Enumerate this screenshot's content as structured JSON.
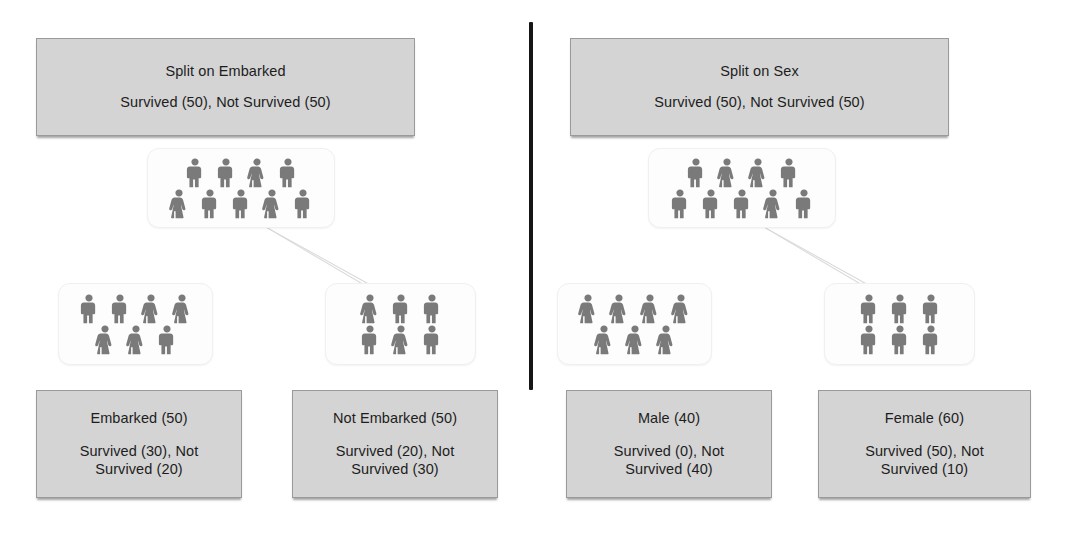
{
  "figure": {
    "type": "decision-tree-comparison",
    "divider": {
      "color": "#161616"
    }
  },
  "panels": [
    {
      "id": "embarked",
      "root_box": {
        "title": "Split on Embarked",
        "stats": "Survived (50), Not Survived (50)"
      },
      "root_node": {
        "rows": [
          [
            "male",
            "male",
            "female",
            "male"
          ],
          [
            "female",
            "male",
            "male",
            "female",
            "male"
          ]
        ]
      },
      "children": [
        {
          "node": {
            "rows": [
              [
                "male",
                "male",
                "female",
                "female"
              ],
              [
                "female",
                "female",
                "male"
              ]
            ]
          },
          "box": {
            "title": "Embarked (50)",
            "stats_line1": "Survived (30), Not",
            "stats_line2": "Survived (20)"
          }
        },
        {
          "node": {
            "rows": [
              [
                "female",
                "male",
                "male"
              ],
              [
                "male",
                "female",
                "male"
              ]
            ]
          },
          "box": {
            "title": "Not Embarked (50)",
            "stats_line1": "Survived (20), Not",
            "stats_line2": "Survived (30)"
          }
        }
      ]
    },
    {
      "id": "sex",
      "root_box": {
        "title": "Split on Sex",
        "stats": "Survived (50), Not Survived (50)"
      },
      "root_node": {
        "rows": [
          [
            "male",
            "female",
            "female",
            "male"
          ],
          [
            "male",
            "male",
            "male",
            "female",
            "male"
          ]
        ]
      },
      "children": [
        {
          "node": {
            "rows": [
              [
                "female",
                "female",
                "female",
                "female"
              ],
              [
                "female",
                "female",
                "female"
              ]
            ]
          },
          "box": {
            "title": "Male (40)",
            "stats_line1": "Survived (0), Not",
            "stats_line2": "Survived (40)"
          }
        },
        {
          "node": {
            "rows": [
              [
                "male",
                "male",
                "male"
              ],
              [
                "male",
                "male",
                "male"
              ]
            ]
          },
          "box": {
            "title": "Female (60)",
            "stats_line1": "Survived (50), Not",
            "stats_line2": "Survived (10)"
          }
        }
      ]
    }
  ]
}
